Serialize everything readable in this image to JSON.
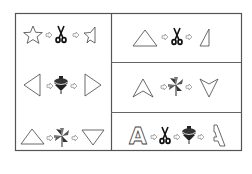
{
  "puzzle": {
    "description": "Shape transformation puzzle: each row shows a shape, one or more operations, and the resulting shape",
    "operation_legend": {
      "scissors": "cut in half",
      "pinwheel": "flip vertically",
      "spinning-top": "flip horizontally"
    },
    "left_column": [
      {
        "start": "star",
        "operations": [
          "scissors"
        ],
        "result": "half-star"
      },
      {
        "start": "triangle-left",
        "operations": [
          "spinning-top"
        ],
        "result": "triangle-right"
      },
      {
        "start": "triangle-up",
        "operations": [
          "pinwheel"
        ],
        "result": "triangle-down"
      }
    ],
    "right_column": [
      {
        "start": "triangle-up",
        "operations": [
          "scissors"
        ],
        "result": "half-triangle"
      },
      {
        "start": "chevron-up",
        "operations": [
          "pinwheel"
        ],
        "result": "chevron-down"
      },
      {
        "start": "letter-A",
        "start_label": "A",
        "operations": [
          "scissors",
          "spinning-top"
        ],
        "result": "half-letter-A-mirrored"
      }
    ],
    "colors": {
      "line": "#555555",
      "shape_stroke": "#444444",
      "icon_fill": "#111111",
      "arrow": "#888888",
      "background": "#ffffff"
    }
  }
}
